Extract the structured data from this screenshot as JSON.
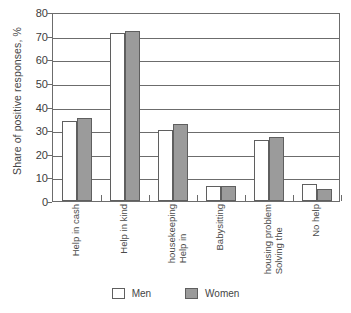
{
  "chart_data": {
    "type": "bar",
    "title": "",
    "xlabel": "",
    "ylabel": "Share of positive responses, %",
    "ylim": [
      0,
      80
    ],
    "yticks": [
      0,
      10,
      20,
      30,
      40,
      50,
      60,
      70,
      80
    ],
    "grid": true,
    "legend_position": "bottom",
    "categories": [
      "Help in cash",
      "Help in kind",
      "Help in housekeeping",
      "Babysitting",
      "Solving the housing problem",
      "No help"
    ],
    "category_lines": [
      [
        "Help in cash"
      ],
      [
        "Help in kind"
      ],
      [
        "Help in",
        "housekeeping"
      ],
      [
        "Babysitting"
      ],
      [
        "Solving the",
        "housing problem"
      ],
      [
        "No help"
      ]
    ],
    "series": [
      {
        "name": "Men",
        "color": "#ffffff",
        "values": [
          34,
          71,
          30,
          6.5,
          26,
          7
        ]
      },
      {
        "name": "Women",
        "color": "#9b9b9b",
        "values": [
          35,
          72,
          32.5,
          6.5,
          27,
          5
        ]
      }
    ]
  },
  "axis": {
    "y_title": "Share of positive responses, %",
    "tick_labels": [
      "80",
      "70",
      "60",
      "50",
      "40",
      "30",
      "20",
      "10",
      "0"
    ]
  },
  "legend": {
    "items": [
      {
        "label": "Men",
        "swatch": "men"
      },
      {
        "label": "Women",
        "swatch": "women"
      }
    ]
  }
}
